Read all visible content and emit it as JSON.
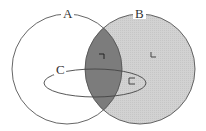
{
  "diagram": {
    "type": "venn",
    "sets": [
      {
        "id": "A",
        "label": "A",
        "shape": "circle",
        "fill": "#ffffff"
      },
      {
        "id": "B",
        "label": "B",
        "shape": "circle",
        "fill": "#d4d4d4"
      },
      {
        "id": "C",
        "label": "C",
        "shape": "ellipse",
        "fill": "none"
      }
    ],
    "regions": [
      {
        "id": "A∩B",
        "fill": "#7a7a7a",
        "symbol": "¬"
      },
      {
        "id": "B only",
        "fill": "#d4d4d4",
        "symbol": "∟"
      },
      {
        "id": "B∩C outside A",
        "fill": "#d4d4d4",
        "symbol": "⊏"
      }
    ],
    "colors": {
      "stroke": "#555555",
      "b_fill": "#d4d4d4",
      "intersection_fill": "#7a7a7a",
      "background": "#ffffff"
    }
  }
}
